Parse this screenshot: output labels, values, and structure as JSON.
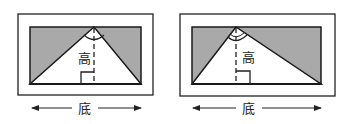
{
  "figures": [
    {
      "id": "left",
      "height_label": "高",
      "base_label": "底",
      "outer": {
        "x": 18,
        "y": 14,
        "w": 135,
        "h": 81
      },
      "inner": {
        "x": 30,
        "y": 27,
        "w": 111,
        "h": 57
      },
      "apex_x": 94
    },
    {
      "id": "right",
      "height_label": "高",
      "base_label": "底",
      "outer": {
        "x": 180,
        "y": 14,
        "w": 155,
        "h": 82
      },
      "inner": {
        "x": 192,
        "y": 27,
        "w": 129,
        "h": 57
      },
      "apex_x": 236
    }
  ],
  "colors": {
    "shade": "#a9a9a9",
    "line": "#1a1a1a"
  }
}
